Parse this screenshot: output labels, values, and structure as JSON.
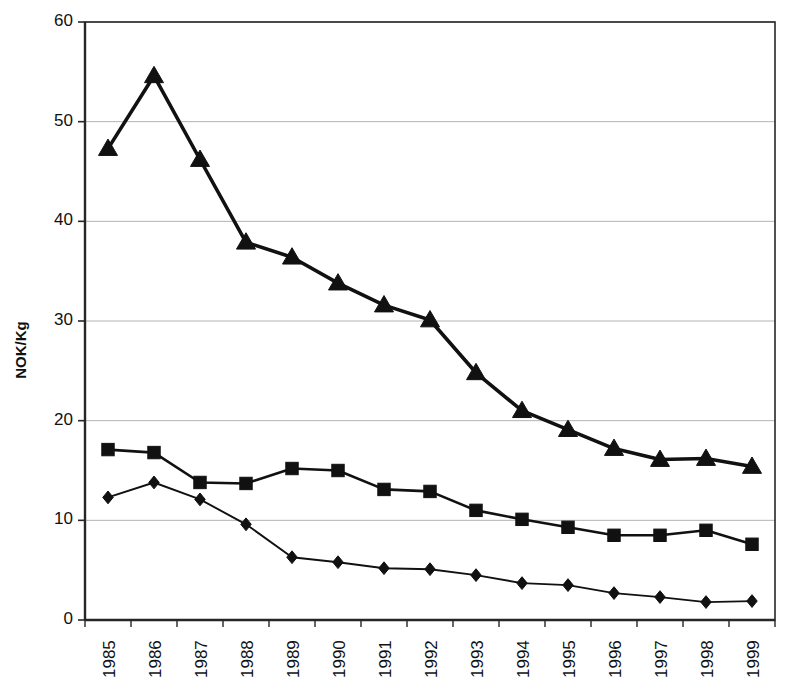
{
  "chart_data": {
    "type": "line",
    "title": "",
    "xlabel": "",
    "ylabel": "NOK/Kg",
    "categories": [
      "1985",
      "1986",
      "1987",
      "1988",
      "1989",
      "1990",
      "1991",
      "1992",
      "1993",
      "1994",
      "1995",
      "1996",
      "1997",
      "1998",
      "1999"
    ],
    "ylim": [
      0,
      60
    ],
    "yticks": [
      0,
      10,
      20,
      30,
      40,
      50,
      60
    ],
    "grid": true,
    "legend": "none",
    "series": [
      {
        "name": "triangle-series",
        "marker": "triangle",
        "color": "#111111",
        "values": [
          47.3,
          54.6,
          46.2,
          37.9,
          36.4,
          33.8,
          31.6,
          30.1,
          24.8,
          21.0,
          19.1,
          17.2,
          16.1,
          16.2,
          15.4
        ]
      },
      {
        "name": "square-series",
        "marker": "square",
        "color": "#111111",
        "values": [
          17.1,
          16.8,
          13.8,
          13.7,
          15.2,
          15.0,
          13.1,
          12.9,
          11.0,
          10.1,
          9.3,
          8.5,
          8.5,
          9.0,
          7.6
        ]
      },
      {
        "name": "diamond-series",
        "marker": "diamond",
        "color": "#111111",
        "values": [
          12.3,
          13.8,
          12.1,
          9.6,
          6.3,
          5.8,
          5.2,
          5.1,
          4.5,
          3.7,
          3.5,
          2.7,
          2.3,
          1.8,
          1.9
        ]
      }
    ]
  },
  "axes": {
    "y_title": "NOK/Kg",
    "y_tick_labels": [
      "0",
      "10",
      "20",
      "30",
      "40",
      "50",
      "60"
    ],
    "x_tick_labels": [
      "1985",
      "1986",
      "1987",
      "1988",
      "1989",
      "1990",
      "1991",
      "1992",
      "1993",
      "1994",
      "1995",
      "1996",
      "1997",
      "1998",
      "1999"
    ]
  },
  "style": {
    "background": "#ffffff",
    "axis_color": "#262626",
    "grid_color": "#b3b3b3",
    "series_color": "#111111"
  }
}
